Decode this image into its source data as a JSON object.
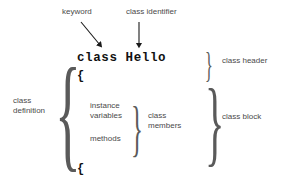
{
  "diagram": {
    "type": "annotated-code-diagram",
    "background_color": "#ffffff",
    "label_color": "#4a4a4a",
    "code_color": "#111111",
    "brace_color": "#5a5a5a"
  },
  "code": {
    "declaration": "class Hello",
    "keyword_token": "class",
    "identifier_token": "Hello",
    "open_brace": "{",
    "close_brace": "{"
  },
  "callouts": {
    "keyword": "keyword",
    "class_identifier": "class identifier"
  },
  "labels": {
    "class_definition": "class\ndefinition",
    "instance_variables": "instance\nvariables",
    "methods": "methods",
    "class_members": "class\nmembers",
    "class_header": "class header",
    "class_block": "class block"
  },
  "braces": {
    "class_definition": "{",
    "class_members": "}",
    "class_header": "}",
    "class_block": "}"
  },
  "arrows": [
    {
      "name": "keyword-arrow",
      "style": "diagonal",
      "from": [
        80,
        22
      ],
      "to": [
        101,
        47
      ]
    },
    {
      "name": "class-identifier-arrow",
      "style": "vertical",
      "from": [
        139,
        22
      ],
      "to": [
        139,
        47
      ]
    }
  ]
}
